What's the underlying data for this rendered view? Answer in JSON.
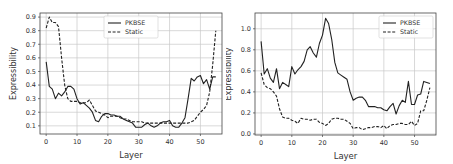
{
  "chart_data": [
    {
      "type": "line",
      "title": "",
      "xlabel": "Layer",
      "ylabel": "Expressibility",
      "xlim": [
        -2,
        57
      ],
      "ylim": [
        0.04,
        0.93
      ],
      "xticks": [
        0,
        10,
        20,
        30,
        40,
        50
      ],
      "yticks": [
        0.1,
        0.2,
        0.3,
        0.4,
        0.5,
        0.6,
        0.7,
        0.8,
        0.9
      ],
      "grid": true,
      "legend_position": "upper center",
      "legend": [
        "PKBSE",
        "Static"
      ],
      "series": [
        {
          "name": "PKBSE",
          "style": "solid",
          "x": [
            0,
            1,
            2,
            3,
            4,
            5,
            6,
            7,
            8,
            9,
            10,
            11,
            12,
            13,
            14,
            15,
            16,
            17,
            18,
            19,
            20,
            21,
            22,
            23,
            24,
            25,
            26,
            27,
            28,
            29,
            30,
            31,
            32,
            33,
            34,
            35,
            36,
            37,
            38,
            39,
            40,
            41,
            42,
            43,
            44,
            45,
            46,
            47,
            48,
            49,
            50,
            51,
            52,
            53,
            54,
            55
          ],
          "values": [
            0.57,
            0.39,
            0.37,
            0.3,
            0.34,
            0.32,
            0.35,
            0.39,
            0.39,
            0.37,
            0.3,
            0.26,
            0.27,
            0.25,
            0.23,
            0.2,
            0.14,
            0.13,
            0.17,
            0.19,
            0.19,
            0.18,
            0.18,
            0.17,
            0.17,
            0.15,
            0.14,
            0.13,
            0.12,
            0.09,
            0.09,
            0.09,
            0.11,
            0.12,
            0.1,
            0.09,
            0.1,
            0.12,
            0.13,
            0.13,
            0.14,
            0.1,
            0.09,
            0.09,
            0.12,
            0.16,
            0.3,
            0.45,
            0.43,
            0.46,
            0.47,
            0.41,
            0.44,
            0.37,
            0.46,
            0.46
          ]
        },
        {
          "name": "Static",
          "style": "dashed",
          "x": [
            0,
            1,
            2,
            3,
            4,
            5,
            6,
            7,
            8,
            9,
            10,
            11,
            12,
            13,
            14,
            15,
            16,
            17,
            18,
            19,
            20,
            21,
            22,
            23,
            24,
            25,
            26,
            27,
            28,
            29,
            30,
            31,
            32,
            33,
            34,
            35,
            36,
            37,
            38,
            39,
            40,
            41,
            42,
            43,
            44,
            45,
            46,
            47,
            48,
            49,
            50,
            51,
            52,
            53,
            54,
            55
          ],
          "values": [
            0.82,
            0.9,
            0.86,
            0.86,
            0.83,
            0.6,
            0.4,
            0.3,
            0.28,
            0.28,
            0.28,
            0.27,
            0.27,
            0.27,
            0.29,
            0.25,
            0.21,
            0.2,
            0.19,
            0.18,
            0.16,
            0.17,
            0.17,
            0.17,
            0.16,
            0.15,
            0.15,
            0.14,
            0.13,
            0.13,
            0.13,
            0.13,
            0.12,
            0.12,
            0.12,
            0.12,
            0.12,
            0.12,
            0.12,
            0.12,
            0.12,
            0.12,
            0.12,
            0.12,
            0.12,
            0.12,
            0.12,
            0.13,
            0.14,
            0.17,
            0.2,
            0.22,
            0.25,
            0.35,
            0.55,
            0.8
          ]
        }
      ]
    },
    {
      "type": "line",
      "title": "",
      "xlabel": "Layer",
      "ylabel": "Expressibility",
      "xlim": [
        -2,
        57
      ],
      "ylim": [
        -0.01,
        1.15
      ],
      "xticks": [
        0,
        10,
        20,
        30,
        40,
        50
      ],
      "yticks": [
        0.0,
        0.2,
        0.4,
        0.6,
        0.8,
        1.0
      ],
      "grid": true,
      "legend_position": "upper right",
      "legend": [
        "PKBSE",
        "Static"
      ],
      "series": [
        {
          "name": "PKBSE",
          "style": "solid",
          "x": [
            0,
            1,
            2,
            3,
            4,
            5,
            6,
            7,
            8,
            9,
            10,
            11,
            12,
            13,
            14,
            15,
            16,
            17,
            18,
            19,
            20,
            21,
            22,
            23,
            24,
            25,
            26,
            27,
            28,
            29,
            30,
            31,
            32,
            33,
            34,
            35,
            36,
            37,
            38,
            39,
            40,
            41,
            42,
            43,
            44,
            45,
            46,
            47,
            48,
            49,
            50,
            51,
            52,
            53,
            54,
            55
          ],
          "values": [
            0.88,
            0.57,
            0.62,
            0.53,
            0.49,
            0.62,
            0.43,
            0.49,
            0.47,
            0.45,
            0.64,
            0.57,
            0.61,
            0.64,
            0.69,
            0.8,
            0.83,
            0.77,
            0.73,
            0.86,
            0.94,
            1.1,
            1.05,
            0.9,
            0.68,
            0.58,
            0.56,
            0.54,
            0.52,
            0.4,
            0.32,
            0.34,
            0.35,
            0.35,
            0.32,
            0.26,
            0.26,
            0.26,
            0.25,
            0.25,
            0.23,
            0.22,
            0.26,
            0.29,
            0.19,
            0.27,
            0.32,
            0.3,
            0.5,
            0.28,
            0.28,
            0.37,
            0.38,
            0.5,
            0.49,
            0.48
          ]
        },
        {
          "name": "Static",
          "style": "dashed",
          "x": [
            0,
            1,
            2,
            3,
            4,
            5,
            6,
            7,
            8,
            9,
            10,
            11,
            12,
            13,
            14,
            15,
            16,
            17,
            18,
            19,
            20,
            21,
            22,
            23,
            24,
            25,
            26,
            27,
            28,
            29,
            30,
            31,
            32,
            33,
            34,
            35,
            36,
            37,
            38,
            39,
            40,
            41,
            42,
            43,
            44,
            45,
            46,
            47,
            48,
            49,
            50,
            51,
            52,
            53,
            54,
            55
          ],
          "values": [
            0.58,
            0.47,
            0.44,
            0.43,
            0.4,
            0.36,
            0.24,
            0.16,
            0.15,
            0.15,
            0.13,
            0.12,
            0.1,
            0.15,
            0.14,
            0.14,
            0.13,
            0.14,
            0.14,
            0.11,
            0.1,
            0.08,
            0.1,
            0.14,
            0.15,
            0.15,
            0.14,
            0.14,
            0.12,
            0.1,
            0.05,
            0.06,
            0.06,
            0.04,
            0.05,
            0.06,
            0.06,
            0.07,
            0.07,
            0.06,
            0.08,
            0.05,
            0.08,
            0.09,
            0.09,
            0.1,
            0.1,
            0.09,
            0.09,
            0.12,
            0.08,
            0.1,
            0.22,
            0.22,
            0.32,
            0.44
          ]
        }
      ]
    }
  ]
}
